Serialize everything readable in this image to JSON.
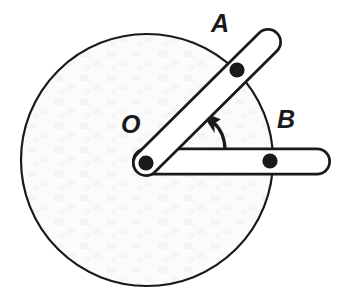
{
  "figure": {
    "kind": "mechanism-diagram",
    "background_color": "#ffffff",
    "stroke_color": "#1a1a1a",
    "labels": [
      {
        "name": "O",
        "text": "O",
        "role": "pivot-center-label"
      },
      {
        "name": "A",
        "text": "A",
        "role": "upper-link-label"
      },
      {
        "name": "B",
        "text": "B",
        "role": "lower-link-label"
      }
    ],
    "disk": {
      "name": "disk",
      "center_x": 147,
      "center_y": 160,
      "radius": 126,
      "fill_color": "#fbfbfb",
      "stroke_color": "#1a1a1a",
      "stroke_width": 2
    },
    "pivot": {
      "name": "pivot-O",
      "x": 146,
      "y": 163,
      "pin_radius": 7.5,
      "pin_color": "#1a1a1a"
    },
    "link_a": {
      "name": "link-OA",
      "from_x": 146,
      "from_y": 163,
      "to_x": 268,
      "to_y": 42,
      "half_width": 12,
      "pin_x": 237,
      "pin_y": 70,
      "pin_radius": 7.5,
      "fill_color": "#ffffff",
      "stroke_color": "#1a1a1a",
      "stroke_width": 3
    },
    "link_b": {
      "name": "link-OB",
      "from_x": 146,
      "from_y": 163,
      "to_x": 317,
      "to_y": 161,
      "half_width": 12,
      "pin_x": 270,
      "pin_y": 161,
      "pin_radius": 7.5,
      "fill_color": "#ffffff",
      "stroke_color": "#1a1a1a",
      "stroke_width": 3
    },
    "angle_marker": {
      "name": "angle-arrow",
      "arc_start_x": 224,
      "arc_start_y": 150,
      "arc_end_x": 211,
      "arc_end_y": 124,
      "arrow_tip_x": 203,
      "arrow_tip_y": 114,
      "stroke_color": "#1a1a1a",
      "stroke_width": 3,
      "label": ""
    },
    "reference_line": {
      "name": "reference-horizontal",
      "from_x": 152,
      "from_y": 150,
      "to_x": 317,
      "to_y": 150
    }
  }
}
